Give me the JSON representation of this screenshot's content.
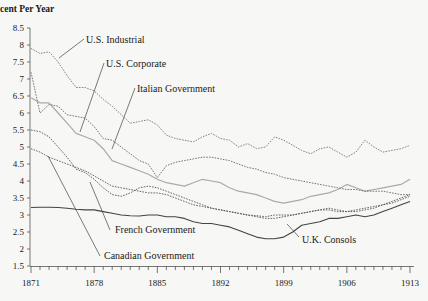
{
  "chart_data": {
    "type": "line",
    "title": "",
    "ylabel": "Percent Per Year",
    "ylabel_visible": "cent Per Year",
    "xlabel": "",
    "xlim": [
      1871,
      1913
    ],
    "ylim": [
      1.5,
      8.5
    ],
    "x_ticks": [
      1871,
      1878,
      1885,
      1892,
      1899,
      1906,
      1913
    ],
    "y_ticks": [
      1.5,
      2,
      2.5,
      3,
      3.5,
      4,
      4.5,
      5,
      5.5,
      6,
      6.5,
      7,
      7.5,
      8,
      8.5
    ],
    "grid": false,
    "series": [
      {
        "name": "U.S. Industrial",
        "style": "dotted",
        "color": "#777777",
        "x": [
          1871,
          1872,
          1873,
          1874,
          1875,
          1876,
          1877,
          1878,
          1879,
          1880,
          1881,
          1882,
          1883,
          1884,
          1885,
          1886,
          1887,
          1888,
          1889,
          1890,
          1891,
          1892,
          1893,
          1894,
          1895,
          1896,
          1897,
          1898,
          1899,
          1900,
          1901,
          1902,
          1903,
          1904,
          1905,
          1906,
          1907,
          1908,
          1909,
          1910,
          1911,
          1912,
          1913
        ],
        "values": [
          7.9,
          7.75,
          7.8,
          7.5,
          7.1,
          6.75,
          6.75,
          6.65,
          6.4,
          6.2,
          5.95,
          5.7,
          5.75,
          5.8,
          5.65,
          5.35,
          5.25,
          5.2,
          5.15,
          5.3,
          5.4,
          5.25,
          5.2,
          5.0,
          5.1,
          4.95,
          5.0,
          5.3,
          5.2,
          5.05,
          4.9,
          4.8,
          4.95,
          5.0,
          4.85,
          4.7,
          4.85,
          5.2,
          5.0,
          4.85,
          4.9,
          4.95,
          5.05
        ]
      },
      {
        "name": "U.S. Corporate",
        "style": "solid-light",
        "color": "#aaaaaa",
        "x": [
          1871,
          1872,
          1873,
          1874,
          1875,
          1876,
          1877,
          1878,
          1879,
          1880,
          1881,
          1882,
          1883,
          1884,
          1885,
          1886,
          1887,
          1888,
          1889,
          1890,
          1891,
          1892,
          1893,
          1894,
          1895,
          1896,
          1897,
          1898,
          1899,
          1900,
          1901,
          1902,
          1903,
          1904,
          1905,
          1906,
          1907,
          1908,
          1909,
          1910,
          1911,
          1912,
          1913
        ],
        "values": [
          6.45,
          6.3,
          6.3,
          6.0,
          5.7,
          5.4,
          5.3,
          5.2,
          4.95,
          4.6,
          4.5,
          4.4,
          4.3,
          4.2,
          4.05,
          3.95,
          3.9,
          3.85,
          3.95,
          4.05,
          4.0,
          3.95,
          3.8,
          3.7,
          3.65,
          3.6,
          3.5,
          3.4,
          3.35,
          3.4,
          3.45,
          3.55,
          3.6,
          3.65,
          3.75,
          3.9,
          3.8,
          3.7,
          3.75,
          3.8,
          3.85,
          3.9,
          4.05
        ]
      },
      {
        "name": "Italian Government",
        "style": "dotted",
        "color": "#666666",
        "x": [
          1871,
          1872,
          1873,
          1874,
          1875,
          1876,
          1877,
          1878,
          1879,
          1880,
          1881,
          1882,
          1883,
          1884,
          1885,
          1886,
          1887,
          1888,
          1889,
          1890,
          1891,
          1892,
          1893,
          1894,
          1895,
          1896,
          1897,
          1898,
          1899,
          1900,
          1901,
          1902,
          1903,
          1904,
          1905,
          1906,
          1907,
          1908,
          1909,
          1910,
          1911,
          1912,
          1913
        ],
        "values": [
          7.2,
          6.0,
          6.25,
          6.2,
          5.95,
          5.9,
          5.85,
          5.6,
          5.25,
          5.2,
          5.0,
          4.8,
          4.6,
          4.5,
          4.1,
          4.45,
          4.55,
          4.6,
          4.65,
          4.7,
          4.7,
          4.65,
          4.6,
          4.5,
          4.4,
          4.35,
          4.25,
          4.2,
          4.1,
          4.05,
          4.0,
          3.95,
          3.9,
          3.85,
          3.8,
          3.75,
          3.75,
          3.7,
          3.7,
          3.7,
          3.65,
          3.6,
          3.6
        ]
      },
      {
        "name": "French Government",
        "style": "dotted",
        "color": "#555555",
        "x": [
          1871,
          1872,
          1873,
          1874,
          1875,
          1876,
          1877,
          1878,
          1879,
          1880,
          1881,
          1882,
          1883,
          1884,
          1885,
          1886,
          1887,
          1888,
          1889,
          1890,
          1891,
          1892,
          1893,
          1894,
          1895,
          1896,
          1897,
          1898,
          1899,
          1900,
          1901,
          1902,
          1903,
          1904,
          1905,
          1906,
          1907,
          1908,
          1909,
          1910,
          1911,
          1912,
          1913
        ],
        "values": [
          5.5,
          5.45,
          5.3,
          5.0,
          4.7,
          4.35,
          4.25,
          4.05,
          3.8,
          3.6,
          3.55,
          3.65,
          3.8,
          3.85,
          3.8,
          3.7,
          3.6,
          3.5,
          3.4,
          3.3,
          3.2,
          3.15,
          3.1,
          3.05,
          3.0,
          2.98,
          2.95,
          3.0,
          3.0,
          3.0,
          3.05,
          3.1,
          3.15,
          3.2,
          3.15,
          3.1,
          3.1,
          3.15,
          3.2,
          3.3,
          3.4,
          3.5,
          3.6
        ]
      },
      {
        "name": "Canadian Government",
        "style": "dotted",
        "color": "#555555",
        "x": [
          1871,
          1872,
          1873,
          1874,
          1875,
          1876,
          1877,
          1878,
          1879,
          1880,
          1881,
          1882,
          1883,
          1884,
          1885,
          1886,
          1887,
          1888,
          1889,
          1890,
          1891,
          1892,
          1893,
          1894,
          1895,
          1896,
          1897,
          1898,
          1899,
          1900,
          1901,
          1902,
          1903,
          1904,
          1905,
          1906,
          1907,
          1908,
          1909,
          1910,
          1911,
          1912,
          1913
        ],
        "values": [
          4.95,
          4.85,
          4.7,
          4.6,
          4.5,
          4.4,
          4.3,
          4.15,
          4.0,
          3.85,
          3.8,
          3.75,
          3.7,
          3.65,
          3.65,
          3.6,
          3.5,
          3.4,
          3.3,
          3.25,
          3.2,
          3.15,
          3.1,
          3.05,
          3.0,
          2.95,
          2.9,
          2.9,
          2.95,
          3.0,
          3.05,
          3.1,
          3.15,
          3.15,
          3.1,
          3.1,
          3.15,
          3.2,
          3.25,
          3.3,
          3.35,
          3.45,
          3.55
        ]
      },
      {
        "name": "U.K. Consols",
        "style": "solid",
        "color": "#444444",
        "x": [
          1871,
          1872,
          1873,
          1874,
          1875,
          1876,
          1877,
          1878,
          1879,
          1880,
          1881,
          1882,
          1883,
          1884,
          1885,
          1886,
          1887,
          1888,
          1889,
          1890,
          1891,
          1892,
          1893,
          1894,
          1895,
          1896,
          1897,
          1898,
          1899,
          1900,
          1901,
          1902,
          1903,
          1904,
          1905,
          1906,
          1907,
          1908,
          1909,
          1910,
          1911,
          1912,
          1913
        ],
        "values": [
          3.22,
          3.23,
          3.23,
          3.22,
          3.2,
          3.17,
          3.15,
          3.15,
          3.1,
          3.05,
          3.0,
          2.98,
          2.97,
          3.0,
          3.0,
          2.95,
          2.95,
          2.9,
          2.8,
          2.75,
          2.75,
          2.7,
          2.65,
          2.55,
          2.45,
          2.35,
          2.3,
          2.3,
          2.35,
          2.5,
          2.7,
          2.75,
          2.8,
          2.9,
          2.9,
          2.95,
          3.0,
          2.95,
          3.0,
          3.1,
          3.2,
          3.3,
          3.4
        ]
      }
    ],
    "annotations": [
      {
        "text": "U.S. Industrial",
        "series": "U.S. Industrial",
        "at_year": 1877,
        "at_value": 7.75
      },
      {
        "text": "U.S. Corporate",
        "series": "U.S. Corporate",
        "at_year": 1879,
        "at_value": 7.0
      },
      {
        "text": "Italian Government",
        "series": "Italian Government",
        "at_year": 1883,
        "at_value": 6.4
      },
      {
        "text": "French Government",
        "series": "French Government",
        "at_year": 1880.5,
        "at_value": 2.55
      },
      {
        "text": "Canadian Government",
        "series": "Canadian Government",
        "at_year": 1880,
        "at_value": 1.95
      },
      {
        "text": "U.K. Consols",
        "series": "U.K. Consols",
        "at_year": 1903.5,
        "at_value": 2.2
      }
    ]
  }
}
